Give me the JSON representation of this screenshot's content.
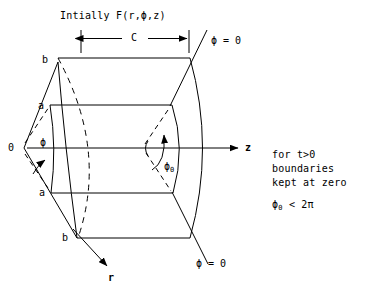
{
  "figure": {
    "title": "Intially F(r,ϕ,z)",
    "dimension_label": "C",
    "origin_label": "0",
    "axes": {
      "z_label": "z",
      "r_label": "r"
    },
    "radii_labels": {
      "outer_top": "b",
      "inner_top": "a",
      "inner_bottom": "a",
      "outer_bottom": "b"
    },
    "angles": {
      "phi": "ϕ",
      "phi_zero_symbol": "ϕ",
      "phi_zero_subscript": "0"
    },
    "boundary_labels": {
      "top": "ϕ = 0",
      "bottom": "ϕ = 0"
    },
    "notes": {
      "line1": "for t>0",
      "line2": "boundaries",
      "line3": "kept at zero",
      "inequality_symbol": "ϕ",
      "inequality_subscript": "0",
      "inequality_rest": " < 2π"
    },
    "colors": {
      "ink": "#000000",
      "background": "#ffffff"
    }
  }
}
